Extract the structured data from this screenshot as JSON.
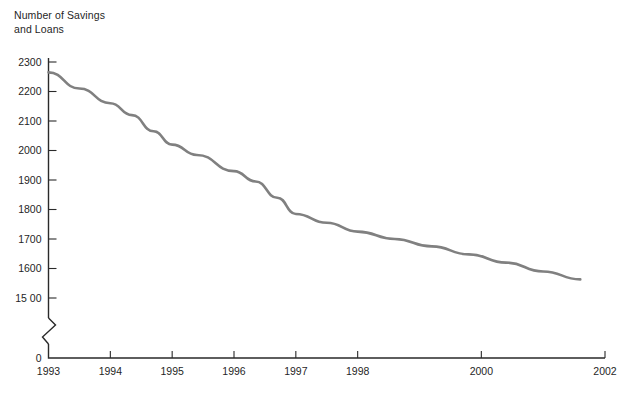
{
  "chart_data": {
    "type": "line",
    "title": "Number of Savings\nand Loans",
    "xlabel": "",
    "ylabel": "Number of Savings and Loans",
    "x_tick_labels": [
      "1993",
      "1994",
      "1995",
      "1996",
      "1997",
      "1998",
      "2000",
      "2002"
    ],
    "x_tick_values": [
      1993,
      1994,
      1995,
      1996,
      1997,
      1998,
      2000,
      2002
    ],
    "y_tick_labels": [
      "2300",
      "2200",
      "2100",
      "2000",
      "1900",
      "1800",
      "1700",
      "1600",
      "15 00",
      "0"
    ],
    "y_tick_values": [
      2300,
      2200,
      2100,
      2000,
      1900,
      1800,
      1700,
      1600,
      1500,
      0
    ],
    "ylim": [
      1500,
      2300
    ],
    "xlim": [
      1993,
      2002
    ],
    "axis_break": true,
    "axis_break_note": "zigzag break on y-axis between 1500 and 0",
    "grid": false,
    "legend": "none",
    "line_color": "#808080",
    "axis_color": "#2a2a2a",
    "background_color": "#ffffff",
    "x": [
      1993.0,
      1993.5,
      1994.0,
      1994.35,
      1994.7,
      1995.0,
      1995.4,
      1996.0,
      1996.35,
      1996.7,
      1997.0,
      1997.5,
      1998.0,
      1998.6,
      1999.2,
      1999.8,
      2000.4,
      2001.0,
      2001.6
    ],
    "values": [
      2265,
      2210,
      2160,
      2120,
      2065,
      2020,
      1985,
      1930,
      1895,
      1840,
      1785,
      1755,
      1725,
      1700,
      1675,
      1648,
      1620,
      1590,
      1563
    ],
    "series": [
      {
        "name": "Number of Savings and Loans",
        "values": [
          2265,
          2210,
          2160,
          2120,
          2065,
          2020,
          1985,
          1930,
          1895,
          1840,
          1785,
          1755,
          1725,
          1700,
          1675,
          1648,
          1620,
          1590,
          1563
        ]
      }
    ],
    "annotations": []
  }
}
